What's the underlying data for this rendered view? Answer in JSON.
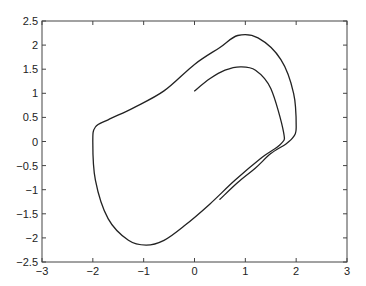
{
  "chart_data": {
    "type": "line",
    "title": "",
    "xlabel": "",
    "ylabel": "",
    "xlim": [
      -3,
      3
    ],
    "ylim": [
      -2.5,
      2.5
    ],
    "grid": false,
    "legend": null,
    "xticks": [
      "-3",
      "-2",
      "-1",
      "0",
      "1",
      "2",
      "3"
    ],
    "yticks": [
      "2.5",
      "2",
      "1.5",
      "1",
      "0.5",
      "0",
      "-0.5",
      "-1",
      "-1.5",
      "-2",
      "-2.5"
    ],
    "series": [
      {
        "name": "trajectory",
        "color": "#222222",
        "x": [
          0.0,
          0.3,
          0.6,
          0.9,
          1.2,
          1.5,
          1.75,
          1.7,
          1.3,
          0.8,
          0.3,
          -0.2,
          -0.6,
          -0.95,
          -1.3,
          -1.7,
          -1.95,
          -2.0,
          -1.95,
          -1.7,
          -1.2,
          -0.6,
          0.0,
          0.5,
          0.85,
          1.25,
          1.7,
          1.95,
          2.0,
          1.95,
          1.8,
          1.5,
          1.2,
          0.85,
          0.5
        ],
        "y": [
          1.05,
          1.3,
          1.48,
          1.55,
          1.48,
          1.1,
          0.2,
          -0.05,
          -0.35,
          -0.8,
          -1.3,
          -1.75,
          -2.05,
          -2.15,
          -2.05,
          -1.6,
          -0.8,
          0.0,
          0.3,
          0.45,
          0.7,
          1.05,
          1.6,
          1.95,
          2.2,
          2.15,
          1.7,
          1.0,
          0.3,
          0.1,
          -0.05,
          -0.25,
          -0.55,
          -0.85,
          -1.2
        ]
      }
    ]
  }
}
